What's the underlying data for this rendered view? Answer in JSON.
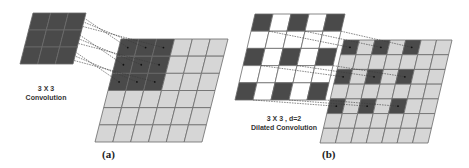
{
  "colors": {
    "dark_cell": "#4a4a4a",
    "light_cell": "#d6d6d6",
    "white_cell": "#ffffff",
    "grid_line": "#6a6a6a",
    "connector": "#3a3a3a"
  },
  "panels": [
    {
      "id": "a",
      "letter": "(a)",
      "caption_line1": "3 X 3",
      "caption_line2": "Convolution",
      "kernel": {
        "rows": 3,
        "cols": 3,
        "top_left": [
          33,
          13
        ],
        "top_right": [
          86,
          13
        ],
        "bottom_left": [
          20,
          64
        ],
        "bottom_right": [
          73,
          64
        ],
        "pattern": "solid"
      },
      "output": {
        "rows": 6,
        "cols": 6,
        "top_left": [
          121,
          39
        ],
        "top_right": [
          228,
          39
        ],
        "bottom_left": [
          95,
          142
        ],
        "bottom_right": [
          202,
          142
        ],
        "dark_cells": [
          [
            0,
            0
          ],
          [
            0,
            1
          ],
          [
            0,
            2
          ],
          [
            1,
            0
          ],
          [
            1,
            1
          ],
          [
            1,
            2
          ],
          [
            2,
            0
          ],
          [
            2,
            1
          ],
          [
            2,
            2
          ]
        ]
      }
    },
    {
      "id": "b",
      "letter": "(b)",
      "caption_line1": "3 X 3 , d=2",
      "caption_line2": "Dilated Convolution",
      "kernel": {
        "rows": 5,
        "cols": 5,
        "top_left": [
          255,
          14
        ],
        "top_right": [
          345,
          14
        ],
        "bottom_left": [
          235,
          100
        ],
        "bottom_right": [
          325,
          100
        ],
        "pattern": "dilated"
      },
      "output": {
        "rows": 7,
        "cols": 7,
        "top_left": [
          344,
          40
        ],
        "top_right": [
          452,
          40
        ],
        "bottom_left": [
          320,
          143
        ],
        "bottom_right": [
          428,
          143
        ],
        "dark_cells": [
          [
            0,
            0
          ],
          [
            0,
            2
          ],
          [
            0,
            4
          ],
          [
            2,
            0
          ],
          [
            2,
            2
          ],
          [
            2,
            4
          ],
          [
            4,
            0
          ],
          [
            4,
            2
          ],
          [
            4,
            4
          ]
        ]
      }
    }
  ]
}
